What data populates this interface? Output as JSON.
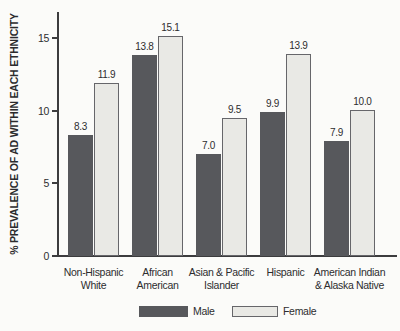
{
  "chart_data": {
    "type": "bar",
    "title": "",
    "xlabel": "",
    "ylabel": "% PREVALENCE OF AD WITHIN EACH ETHNICITY",
    "ylim": [
      0,
      16.8
    ],
    "yticks": [
      0,
      5,
      10,
      15
    ],
    "grid": false,
    "legend_position": "bottom",
    "categories": [
      "Non-Hispanic\nWhite",
      "African\nAmerican",
      "Asian & Pacific\nIslander",
      "Hispanic",
      "American Indian\n& Alaska Native"
    ],
    "series": [
      {
        "name": "Male",
        "color": "#57585c",
        "values": [
          8.3,
          13.8,
          7.0,
          9.9,
          7.9
        ]
      },
      {
        "name": "Female",
        "color": "#e9e9e5",
        "values": [
          11.9,
          15.1,
          9.5,
          13.9,
          10.0
        ]
      }
    ],
    "value_label_decimals": 1
  },
  "colors": {
    "background": "#fbfbf9",
    "axis": "#3c3c3e",
    "text": "#2d2d2f",
    "male_bar": "#57585c",
    "female_bar_fill": "#e9e9e5",
    "female_bar_border": "#66666a"
  }
}
